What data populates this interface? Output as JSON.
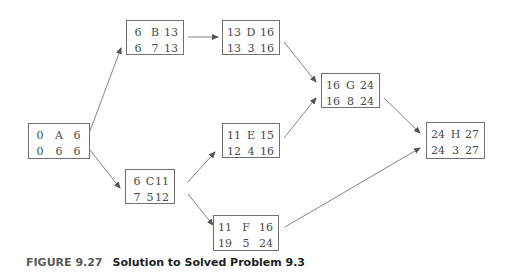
{
  "diagram": {
    "type": "activity-on-node network",
    "nodes": [
      {
        "id": "A",
        "es": "0",
        "ef": "6",
        "ls": "0",
        "slack": "6",
        "lf": "6"
      },
      {
        "id": "B",
        "es": "6",
        "ef": "13",
        "ls": "6",
        "slack": "7",
        "lf": "13"
      },
      {
        "id": "C",
        "es": "6",
        "ef": "11",
        "ls": "7",
        "slack": "5",
        "lf": "12"
      },
      {
        "id": "D",
        "es": "13",
        "ef": "16",
        "ls": "13",
        "slack": "3",
        "lf": "16"
      },
      {
        "id": "E",
        "es": "11",
        "ef": "15",
        "ls": "12",
        "slack": "4",
        "lf": "16"
      },
      {
        "id": "F",
        "es": "11",
        "ef": "16",
        "ls": "19",
        "slack": "5",
        "lf": "24"
      },
      {
        "id": "G",
        "es": "16",
        "ef": "24",
        "ls": "16",
        "slack": "8",
        "lf": "24"
      },
      {
        "id": "H",
        "es": "24",
        "ef": "27",
        "ls": "24",
        "slack": "3",
        "lf": "27"
      }
    ],
    "edges": [
      [
        "A",
        "B"
      ],
      [
        "A",
        "C"
      ],
      [
        "B",
        "D"
      ],
      [
        "C",
        "E"
      ],
      [
        "C",
        "F"
      ],
      [
        "D",
        "G"
      ],
      [
        "E",
        "G"
      ],
      [
        "G",
        "H"
      ],
      [
        "F",
        "H"
      ]
    ]
  },
  "caption": {
    "figure_label": "FIGURE 9.27",
    "text": "Solution to Solved Problem 9.3"
  }
}
